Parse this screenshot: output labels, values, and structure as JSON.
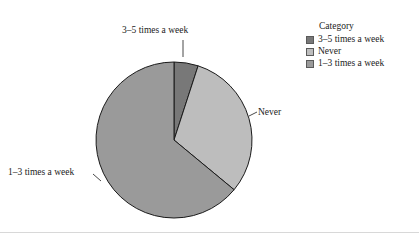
{
  "background": "#ffffff",
  "legend": {
    "title": "Category",
    "entries": [
      {
        "label": "3–5 times a week",
        "color": "#787878"
      },
      {
        "label": "Never",
        "color": "#bdbdbd"
      },
      {
        "label": "1–3 times a week",
        "color": "#9a9a9a"
      }
    ]
  },
  "labels": {
    "top": "3–5 times a week",
    "right": "Never",
    "left": "1–3 times a week"
  },
  "chart_data": {
    "type": "pie",
    "title": "",
    "legend_title": "Category",
    "legend_position": "top-right",
    "categories": [
      "3–5 times a week",
      "Never",
      "1–3 times a week"
    ],
    "values": [
      5,
      31,
      64
    ],
    "unit": "percent",
    "colors": [
      "#787878",
      "#bdbdbd",
      "#9a9a9a"
    ],
    "outline_color": "#1a1a1a",
    "start_angle_deg": 0,
    "direction": "clockwise",
    "center_px": [
      174,
      140
    ],
    "radius_px": 78,
    "annotations": [
      {
        "text": "3–5 times a week",
        "position": "top",
        "leader": true
      },
      {
        "text": "Never",
        "position": "right",
        "leader": true
      },
      {
        "text": "1–3 times a week",
        "position": "left",
        "leader": true
      }
    ]
  }
}
